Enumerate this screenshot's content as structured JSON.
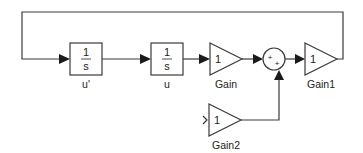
{
  "diagram": {
    "type": "simulink-block-diagram",
    "blocks": [
      {
        "id": "integrator1",
        "kind": "integrator",
        "numerator": "1",
        "denominator": "s",
        "label": "u'"
      },
      {
        "id": "integrator2",
        "kind": "integrator",
        "numerator": "1",
        "denominator": "s",
        "label": "u"
      },
      {
        "id": "gain",
        "kind": "gain",
        "value": "1",
        "label": "Gain"
      },
      {
        "id": "sum",
        "kind": "sum",
        "signs": [
          "+",
          "+"
        ],
        "label": ""
      },
      {
        "id": "gain1",
        "kind": "gain",
        "value": "1",
        "label": "Gain1"
      },
      {
        "id": "gain2",
        "kind": "gain",
        "value": "1",
        "label": "Gain2"
      }
    ],
    "connections": [
      {
        "from": "gain1",
        "to": "integrator1",
        "note": "feedback loop over top"
      },
      {
        "from": "integrator1",
        "to": "integrator2"
      },
      {
        "from": "integrator2",
        "to": "gain"
      },
      {
        "from": "gain",
        "to": "sum"
      },
      {
        "from": "gain2",
        "to": "sum"
      },
      {
        "from": "sum",
        "to": "gain1"
      }
    ],
    "colors": {
      "line": "#3a3a3a",
      "arrow": "#1a1a1a",
      "background": "#ffffff"
    }
  }
}
